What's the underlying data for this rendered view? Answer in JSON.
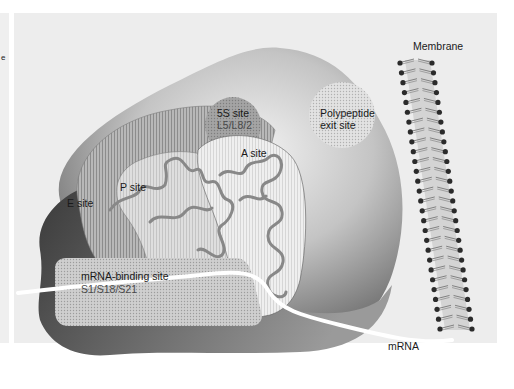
{
  "figure": {
    "left_strip_mark": "e",
    "labels": {
      "membrane": "Membrane",
      "five_s_site": "5S site",
      "five_s_proteins": "L5/L8/2",
      "polypeptide_exit_line1": "Polypeptide",
      "polypeptide_exit_line2": "exit site",
      "a_site": "A site",
      "p_site": "P site",
      "e_site": "E site",
      "mrna_binding_site": "mRNA-binding site",
      "mrna_binding_proteins": "S1/S18/S21",
      "mrna": "mRNA"
    },
    "colors": {
      "panel_bg": "#ededed",
      "large_subunit_light": "#dcdcdc",
      "large_subunit_dark": "#5a5a5a",
      "small_subunit_dark": "#3a3a3a",
      "e_site_fill": "#a8a8a8",
      "p_site_fill": "#d0d0d0",
      "a_site_fill": "#e6e6e6",
      "five_s_fill": "#9a9a9a",
      "exit_site_fill": "#d8d8d8",
      "trna_strand": "#8a8a8a",
      "mrna_strand": "#ffffff",
      "lipid_head": "#2b2b2b",
      "lipid_tail": "#777777"
    }
  }
}
